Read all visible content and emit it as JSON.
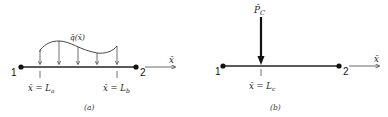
{
  "figure_a": {
    "node_start": "1",
    "node_end": "2",
    "axis_label": "x̄",
    "load_label": "q̄(x̄)",
    "start_position_label": "x̄ = L",
    "start_position_sub": "a",
    "end_position_label": "x̄ = L",
    "end_position_sub": "b",
    "caption": "(a)"
  },
  "figure_b": {
    "node_start": "1",
    "node_end": "2",
    "axis_label": "x̄",
    "force_label": "P̄",
    "force_sub": "C",
    "position_label": "x̄ = L",
    "position_sub": "c",
    "caption": "(b)"
  }
}
